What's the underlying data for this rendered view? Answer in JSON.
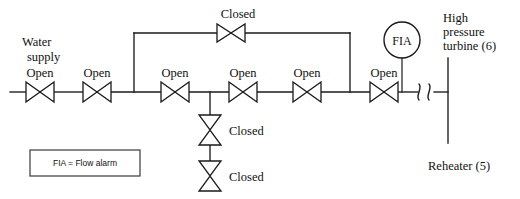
{
  "diagram": {
    "type": "piping-and-instrumentation-diagram",
    "stroke_color": "#1a1a1a",
    "background_color": "#ffffff"
  },
  "labels": {
    "water_supply_line1": "Water",
    "water_supply_line2": "supply",
    "high_pressure_line1": "High",
    "high_pressure_line2": "pressure",
    "high_pressure_line3": "turbine (6)",
    "reheater": "Reheater (5)",
    "instrument_tag": "FIA"
  },
  "legend": {
    "text": "FIA = Flow alarm"
  },
  "main_line_valves": [
    {
      "id": "valve-1",
      "label": "Open",
      "state": "Open",
      "cx": 40,
      "cy": 92,
      "orientation": "horizontal"
    },
    {
      "id": "valve-2",
      "label": "Open",
      "state": "Open",
      "cx": 97,
      "cy": 92,
      "orientation": "horizontal"
    },
    {
      "id": "valve-3",
      "label": "Open",
      "state": "Open",
      "cx": 175,
      "cy": 92,
      "orientation": "horizontal"
    },
    {
      "id": "valve-4",
      "label": "Open",
      "state": "Open",
      "cx": 243,
      "cy": 92,
      "orientation": "horizontal"
    },
    {
      "id": "valve-5",
      "label": "Open",
      "state": "Open",
      "cx": 307,
      "cy": 92,
      "orientation": "horizontal"
    },
    {
      "id": "valve-6",
      "label": "Open",
      "state": "Open",
      "cx": 384,
      "cy": 92,
      "orientation": "horizontal"
    }
  ],
  "bypass_line_valves": [
    {
      "id": "valve-bypass",
      "label": "Closed",
      "state": "Closed",
      "cx": 231,
      "cy": 33,
      "orientation": "horizontal"
    }
  ],
  "drain_line_valves": [
    {
      "id": "valve-drain-upper",
      "label": "Closed",
      "state": "Closed",
      "cx": 210,
      "cy": 130,
      "orientation": "vertical"
    },
    {
      "id": "valve-drain-lower",
      "label": "Closed",
      "state": "Closed",
      "cx": 210,
      "cy": 176,
      "orientation": "vertical"
    }
  ],
  "instruments": [
    {
      "id": "flow-alarm",
      "tag": "FIA",
      "cx": 402,
      "cy": 40,
      "r": 18
    }
  ],
  "annotations": {
    "water_supply_x": 18,
    "water_supply_y": 42,
    "hp_turbine_x": 443,
    "hp_turbine_y": 18,
    "reheater_x": 428,
    "reheater_y": 166
  }
}
